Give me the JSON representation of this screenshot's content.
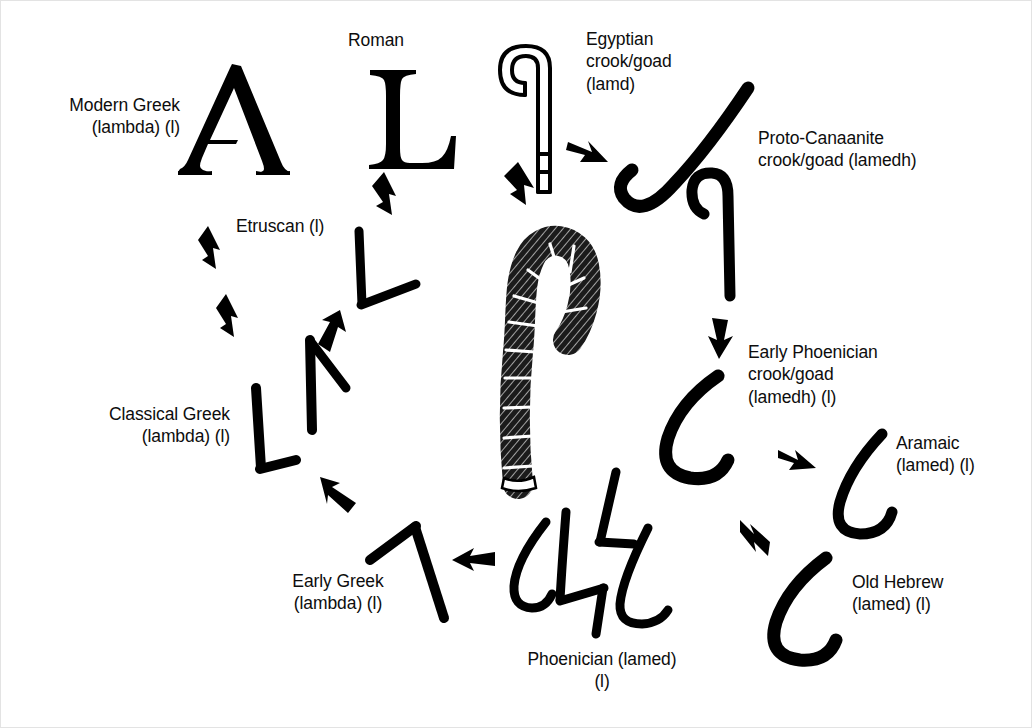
{
  "figure": {
    "background_color": "#ffffff",
    "ink_color": "#000000"
  },
  "labels": {
    "modern_greek": "Modern Greek\n(lambda) (l)",
    "roman": "Roman",
    "etruscan": "Etruscan (l)",
    "classical_greek": "Classical Greek\n(lambda) (l)",
    "early_greek": "Early Greek\n(lambda) (l)",
    "phoenician": "Phoenician (lamed)\n(l)",
    "egyptian": "Egyptian\ncrook/goad\n(lamd)",
    "proto_canaanite": "Proto-Canaanite\ncrook/goad (lamedh)",
    "early_phoenician": "Early Phoenician\ncrook/goad\n(lamedh) (l)",
    "aramaic": "Aramaic\n(lamed) (l)",
    "old_hebrew": "Old Hebrew\n(lamed) (l)"
  },
  "glyph_names": {
    "modern_greek": "lambda-uppercase-serif",
    "roman": "latin-capital-L-serif",
    "etruscan": "etruscan-L-angled",
    "classical_greek": "classical-greek-lambda-pair",
    "early_greek": "early-greek-lambda-inverted-v",
    "phoenician": "phoenician-lamed-group",
    "egyptian_crook_outline": "egyptian-crook-goad-outline",
    "egyptian_shepherd_staff": "egyptian-shepherd-crook-hatched",
    "proto_canaanite": "proto-canaanite-crook-pair",
    "early_phoenician": "early-phoenician-lamed-hook",
    "aramaic": "aramaic-lamed-hook",
    "old_hebrew": "old-hebrew-lamed-hook"
  },
  "arrows": {
    "count": 9,
    "direction_names": [
      "egyptian-to-proto-canaanite",
      "shepherd-staff-to-egyptian-crook",
      "proto-canaanite-to-early-phoenician",
      "early-phoenician-to-aramaic",
      "aramaic-to-old-hebrew",
      "phoenician-to-early-greek",
      "early-greek-to-classical-greek",
      "classical-greek-to-etruscan",
      "etruscan-to-roman"
    ]
  }
}
